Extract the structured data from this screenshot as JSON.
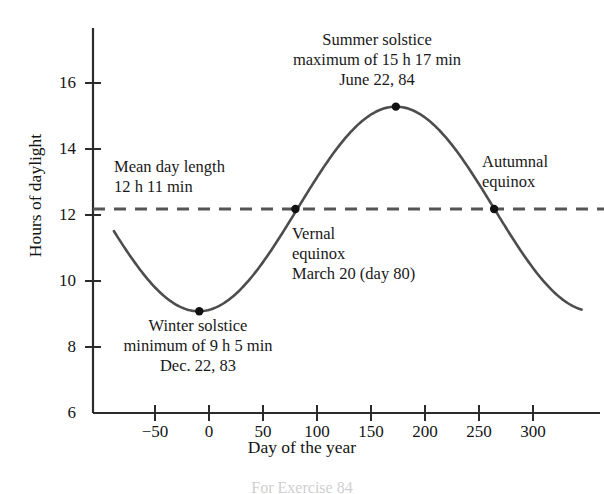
{
  "chart_data": {
    "type": "line",
    "title": "",
    "xlabel": "Day of the year",
    "ylabel": "Hours of daylight",
    "xlim": [
      -88,
      345
    ],
    "ylim": [
      6,
      16.9
    ],
    "xticks": [
      -50,
      0,
      50,
      100,
      150,
      200,
      250,
      300
    ],
    "xtick_labels": [
      "−50",
      "0",
      "50",
      "100",
      "150",
      "200",
      "250",
      "300"
    ],
    "yticks": [
      6,
      8,
      10,
      12,
      14,
      16
    ],
    "ytick_labels": [
      "6",
      "8",
      "10",
      "12",
      "14",
      "16"
    ],
    "grid": false,
    "legend": "none",
    "series": [
      {
        "name": "Hours of daylight",
        "kind": "sinusoid",
        "mean_hours": 12.1833,
        "amplitude_hours": 3.1,
        "min_hours": 9.0833,
        "max_hours": 15.2833,
        "min_day": -9,
        "max_day": 173,
        "period_days": 365,
        "color": "#4d4d4d"
      },
      {
        "name": "Mean day length",
        "kind": "horizontal-dashed",
        "value_hours": 12.1833,
        "color": "#555555"
      }
    ],
    "points": [
      {
        "name": "winter-solstice",
        "x": -9,
        "y": 9.0833
      },
      {
        "name": "vernal-equinox",
        "x": 80,
        "y": 12.1833
      },
      {
        "name": "summer-solstice",
        "x": 173,
        "y": 15.2833
      },
      {
        "name": "autumnal-equinox",
        "x": 264,
        "y": 12.1833
      }
    ],
    "annotations": [
      {
        "name": "summer-solstice",
        "lines": [
          "Summer solstice",
          "maximum of 15 h 17 min",
          "June 22, 84"
        ]
      },
      {
        "name": "mean-day-length",
        "lines": [
          "Mean day length",
          "12 h 11 min"
        ]
      },
      {
        "name": "vernal-equinox",
        "lines": [
          "Vernal",
          "equinox",
          "March 20 (day 80)"
        ]
      },
      {
        "name": "autumnal-equinox",
        "lines": [
          "Autumnal",
          "equinox"
        ]
      },
      {
        "name": "winter-solstice",
        "lines": [
          "Winter solstice",
          "minimum of 9 h 5 min",
          "Dec. 22, 83"
        ]
      }
    ]
  },
  "axes": {
    "ylabel": "Hours of daylight",
    "xlabel": "Day of the year",
    "ytick_labels": [
      "16",
      "14",
      "12",
      "10",
      "8",
      "6"
    ],
    "xtick_labels": [
      "−50",
      "0",
      "50",
      "100",
      "150",
      "200",
      "250",
      "300"
    ]
  },
  "annotations": {
    "summer": {
      "line1": "Summer solstice",
      "line2": "maximum of 15 h 17 min",
      "line3": "June 22, 84"
    },
    "mean": {
      "line1": "Mean day length",
      "line2": "12 h 11 min"
    },
    "vernal": {
      "line1": "Vernal",
      "line2": "equinox",
      "line3": "March 20 (day 80)"
    },
    "autumnal": {
      "line1": "Autumnal",
      "line2": "equinox"
    },
    "winter": {
      "line1": "Winter solstice",
      "line2": "minimum of 9 h 5 min",
      "line3": "Dec. 22, 83"
    }
  },
  "caption": "For Exercise 84",
  "colors": {
    "curve": "#4d4d4d",
    "dashed": "#555555",
    "axis": "#2b2b2b",
    "text": "#141414",
    "background": "#ffffff"
  }
}
